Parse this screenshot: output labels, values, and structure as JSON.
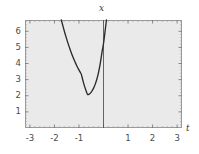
{
  "figure": {
    "background_color": "#ffffff",
    "panel_color": "#eaeaea",
    "frame_color": "#9a9a9a",
    "curve_color": "#2b2b2b",
    "axis_color": "#555555"
  },
  "chart_data": {
    "type": "line",
    "title": "",
    "xlabel": "t",
    "ylabel": "x",
    "xlim": [
      -3.2,
      3.2
    ],
    "ylim": [
      0,
      6.7
    ],
    "grid": false,
    "legend": null,
    "x_ticks": [
      -3,
      -2,
      -1,
      1,
      2,
      3
    ],
    "x_tick_labels": [
      "-3",
      "-2",
      "-1",
      "1",
      "2",
      "3"
    ],
    "y_ticks": [
      1,
      2,
      3,
      4,
      5,
      6
    ],
    "y_tick_labels": [
      "1",
      "2",
      "3",
      "4",
      "5",
      "6"
    ],
    "vertical_axis_line_at": 0,
    "minimum_point": {
      "t": -0.65,
      "x": 2.05
    },
    "series": [
      {
        "name": "x(t)",
        "points": [
          [
            -1.72,
            6.7
          ],
          [
            -1.65,
            6.3
          ],
          [
            -1.6,
            6.02
          ],
          [
            -1.55,
            5.76
          ],
          [
            -1.5,
            5.51
          ],
          [
            -1.45,
            5.27
          ],
          [
            -1.4,
            5.04
          ],
          [
            -1.35,
            4.82
          ],
          [
            -1.3,
            4.62
          ],
          [
            -1.25,
            4.42
          ],
          [
            -1.2,
            4.24
          ],
          [
            -1.15,
            4.06
          ],
          [
            -1.1,
            3.9
          ],
          [
            -1.05,
            3.74
          ],
          [
            -1.0,
            3.6
          ],
          [
            -0.95,
            3.46
          ],
          [
            -0.9,
            3.33
          ],
          [
            -0.85,
            3.0
          ],
          [
            -0.8,
            2.72
          ],
          [
            -0.75,
            2.48
          ],
          [
            -0.7,
            2.28
          ],
          [
            -0.65,
            2.05
          ],
          [
            -0.6,
            2.08
          ],
          [
            -0.55,
            2.14
          ],
          [
            -0.5,
            2.22
          ],
          [
            -0.45,
            2.34
          ],
          [
            -0.4,
            2.48
          ],
          [
            -0.35,
            2.66
          ],
          [
            -0.3,
            2.88
          ],
          [
            -0.25,
            3.14
          ],
          [
            -0.2,
            3.46
          ],
          [
            -0.15,
            3.84
          ],
          [
            -0.1,
            4.3
          ],
          [
            -0.05,
            4.84
          ],
          [
            0.0,
            5.2
          ],
          [
            0.04,
            5.7
          ],
          [
            0.08,
            6.2
          ],
          [
            0.12,
            6.7
          ]
        ]
      }
    ]
  },
  "labels": {
    "x_axis": "x",
    "t_axis": "t"
  }
}
